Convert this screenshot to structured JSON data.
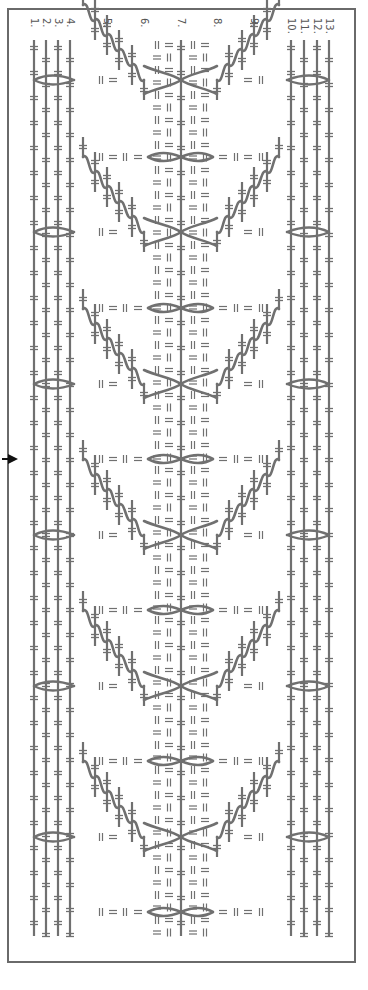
{
  "chart": {
    "title": "",
    "orientation": "rotated-90",
    "stroke_color": "#707070",
    "frame_color": "#6a6a6a",
    "text_color": "#555555",
    "columns_x": [
      34,
      46,
      58,
      70,
      83,
      95,
      107,
      119,
      132,
      144,
      157,
      169,
      181,
      193,
      205,
      217,
      229,
      242,
      254,
      267,
      279,
      291,
      304,
      317,
      329
    ],
    "top_y": 40,
    "bottom_y": 936,
    "repeat_period": 151,
    "eye_rows_y": [
      80,
      232,
      384,
      535,
      686,
      837
    ],
    "figure8_rows_y": [
      157,
      308,
      459,
      610,
      761,
      912
    ],
    "center_column_index": 12,
    "labels": [
      {
        "text": "1.",
        "x": 34
      },
      {
        "text": "2.",
        "x": 46
      },
      {
        "text": "3.",
        "x": 58
      },
      {
        "text": "4.",
        "x": 70
      },
      {
        "text": "5.",
        "x": 107
      },
      {
        "text": "6.",
        "x": 144
      },
      {
        "text": "7.",
        "x": 181
      },
      {
        "text": "8.",
        "x": 217
      },
      {
        "text": "9.",
        "x": 254
      },
      {
        "text": "10.",
        "x": 291
      },
      {
        "text": "11.",
        "x": 304
      },
      {
        "text": "12.",
        "x": 317
      },
      {
        "text": "13.",
        "x": 329
      }
    ],
    "row_marker": {
      "icon": "arrow-right-icon",
      "y": 459
    }
  }
}
